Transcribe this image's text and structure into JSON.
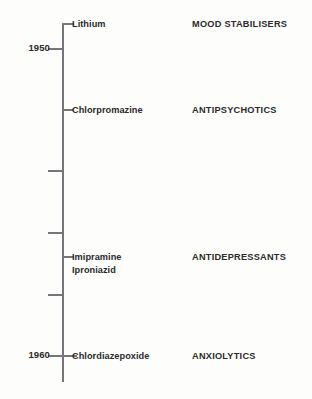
{
  "figure": {
    "background_color": "#fdfdfc",
    "axis_color": "#75757a",
    "text_color": "#2b2b2b"
  },
  "chart_data": {
    "type": "timeline",
    "title": "",
    "xlabel": "",
    "ylabel": "",
    "orientation": "vertical",
    "axis_range": [
      1948,
      1961
    ],
    "grid": false,
    "legend": "none",
    "year_ticks": [
      {
        "label": "1950",
        "y": 48
      },
      {
        "label": "1960",
        "y": 355
      }
    ],
    "minor_ticks": [
      {
        "y": 170,
        "side": "left"
      },
      {
        "y": 232,
        "side": "left"
      },
      {
        "y": 294,
        "side": "left"
      }
    ],
    "events": [
      {
        "drug": "Lithium",
        "drug_class": "MOOD STABILISERS",
        "y": 23,
        "tick_side": "right"
      },
      {
        "drug": "Chlorpromazine",
        "drug_class": "ANTIPSYCHOTICS",
        "y": 109,
        "tick_side": "right"
      },
      {
        "drug": "Imipramine\nIproniazid",
        "drug_class": "ANTIDEPRESSANTS",
        "y": 256,
        "tick_side": "right"
      },
      {
        "drug": "Chlordiazepoxide",
        "drug_class": "ANXIOLYTICS",
        "y": 355,
        "tick_side": "both"
      }
    ],
    "axis_top_y": 23,
    "axis_bottom_y": 382
  }
}
